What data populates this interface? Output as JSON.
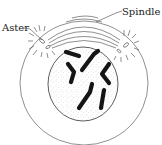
{
  "diagram": {
    "type": "cell-division-prophase",
    "labels": {
      "aster": "Aster",
      "spindle": "Spindle"
    },
    "parts": [
      "cell-membrane",
      "nucleus",
      "chromosomes",
      "aster-left",
      "aster-right",
      "spindle-fibers"
    ],
    "chromosome_count": 6,
    "colors": {
      "line": "#444444",
      "chromosome": "#151515",
      "stipple": "#777777"
    }
  }
}
